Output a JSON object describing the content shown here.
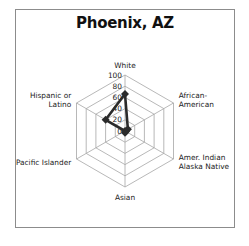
{
  "chart_data": {
    "type": "radar",
    "title": "Phoenix, AZ",
    "categories": [
      "White",
      "African-American",
      "Amer. Indian Alaska Native",
      "Asian",
      "Pacific Islander",
      "Hispanic or Latino"
    ],
    "category_lines": [
      [
        "White"
      ],
      [
        "African-",
        "American"
      ],
      [
        "Amer. Indian",
        "Alaska Native"
      ],
      [
        "Asian"
      ],
      [
        "Pacific Islander"
      ],
      [
        "Hispanic or",
        "Latino"
      ]
    ],
    "series": [
      {
        "name": "Phoenix, AZ",
        "values": [
          66,
          6,
          2,
          3,
          0,
          40
        ]
      }
    ],
    "radial_ticks": [
      "0",
      "20",
      "40",
      "60",
      "80",
      "100"
    ],
    "rlim": [
      0,
      100
    ],
    "grid": true,
    "legend": "none",
    "colors": {
      "series": "#2b2b2b",
      "grid": "#a6a6a6",
      "frame": "#8c8c8c"
    }
  }
}
